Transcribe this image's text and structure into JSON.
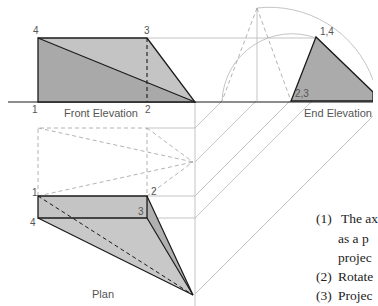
{
  "figure": {
    "views": {
      "front_elevation": "Front Elevation",
      "end_elevation": "End Elevation",
      "plan": "Plan"
    },
    "front_labels": {
      "p4": "4",
      "p3": "3",
      "p1": "1",
      "p2": "2"
    },
    "end_labels": {
      "p14": "1,4",
      "p23": "2,3"
    },
    "plan_labels": {
      "p1": "1",
      "p2": "2",
      "p3": "3",
      "p4": "4"
    },
    "colors": {
      "fill_dark": "#a9a9a9",
      "fill_light": "#c4c4c4",
      "line": "#1a1a1a",
      "construction": "#b0b0b0"
    }
  },
  "notes": [
    {
      "num": "(1)",
      "text": "The ax"
    },
    {
      "num": "",
      "text": "as a p"
    },
    {
      "num": "",
      "text": "projec"
    },
    {
      "num": "(2)",
      "text": "Rotate"
    },
    {
      "num": "(3)",
      "text": "Projec"
    },
    {
      "num": "",
      "text": "l"
    }
  ]
}
